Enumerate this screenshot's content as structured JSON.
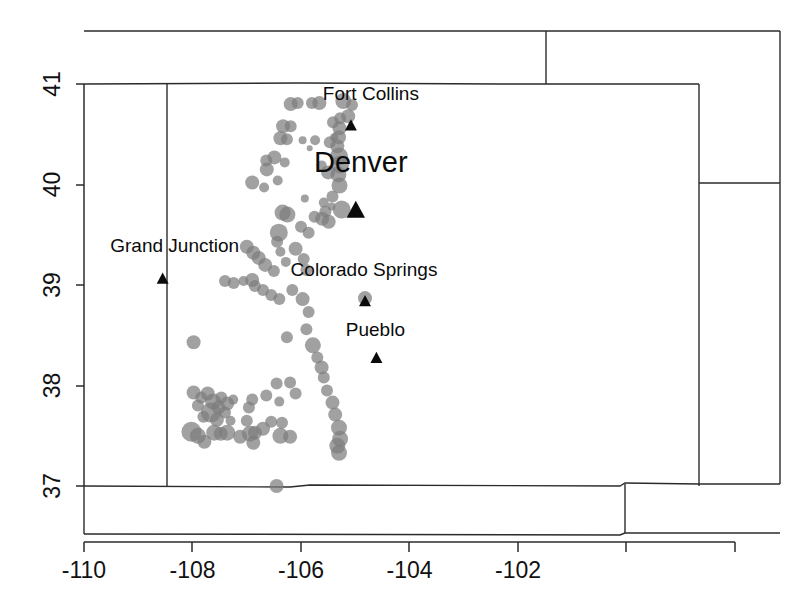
{
  "figure": {
    "title": "",
    "background": "#ffffff",
    "point_color": "#7d7d7d",
    "line_color": "#2b2b2b",
    "marker_color": "#0b0b0b"
  },
  "axes": {
    "x_ticks": [
      "-110",
      "-108",
      "-106",
      "-104",
      "-102"
    ],
    "x_tick_values": [
      -110,
      -108,
      -106,
      -104,
      -102
    ],
    "y_ticks": [
      "37",
      "38",
      "39",
      "40",
      "41"
    ],
    "y_tick_values": [
      37,
      38,
      39,
      40,
      41
    ],
    "xlabel": "",
    "ylabel": "",
    "xlim": [
      -110.5,
      -101.2
    ],
    "ylim": [
      36.5,
      41.5
    ],
    "grid": false
  },
  "cities": [
    {
      "name": "Fort Collins",
      "lon": -105.08,
      "lat": 40.585,
      "label_size": "normal",
      "label_dx": 20,
      "label_dy": -19
    },
    {
      "name": "Denver",
      "lon": -104.99,
      "lat": 39.74,
      "label_size": "major",
      "label_dx": 5,
      "label_dy": -29
    },
    {
      "name": "Colorado Springs",
      "lon": -104.82,
      "lat": 38.835,
      "label_size": "normal",
      "label_dx": -1,
      "label_dy": -19
    },
    {
      "name": "Pueblo",
      "lon": -104.61,
      "lat": 38.27,
      "label_size": "normal",
      "label_dx": -1,
      "label_dy": -16
    },
    {
      "name": "Grand Junction",
      "lon": -108.55,
      "lat": 39.06,
      "label_size": "normal",
      "label_dx": 12,
      "label_dy": -21
    }
  ],
  "chart_data": {
    "type": "scatter",
    "title": "",
    "xlabel": "",
    "ylabel": "",
    "xlim": [
      -110.5,
      -101.2
    ],
    "ylim": [
      36.5,
      41.5
    ],
    "grid": false,
    "point_color": "#7d7d7d",
    "point_opacity": 0.72,
    "size_encodes": "magnitude",
    "size_range_px": [
      3,
      11
    ],
    "legend": null,
    "note": "Earthquake epicenters in Colorado; marker area scales with event magnitude. Triangles mark major cities.",
    "points": [
      {
        "lon": -106.19,
        "lat": 40.8,
        "r": 7
      },
      {
        "lon": -106.06,
        "lat": 40.81,
        "r": 6
      },
      {
        "lon": -105.8,
        "lat": 40.81,
        "r": 6
      },
      {
        "lon": -105.66,
        "lat": 40.81,
        "r": 7
      },
      {
        "lon": -105.22,
        "lat": 40.83,
        "r": 8
      },
      {
        "lon": -105.06,
        "lat": 40.79,
        "r": 6
      },
      {
        "lon": -105.13,
        "lat": 40.68,
        "r": 7
      },
      {
        "lon": -105.28,
        "lat": 40.66,
        "r": 6
      },
      {
        "lon": -106.33,
        "lat": 40.58,
        "r": 7
      },
      {
        "lon": -106.19,
        "lat": 40.58,
        "r": 6
      },
      {
        "lon": -105.41,
        "lat": 40.62,
        "r": 6
      },
      {
        "lon": -105.29,
        "lat": 40.56,
        "r": 7
      },
      {
        "lon": -106.38,
        "lat": 40.46,
        "r": 7
      },
      {
        "lon": -106.26,
        "lat": 40.45,
        "r": 6
      },
      {
        "lon": -105.97,
        "lat": 40.44,
        "r": 4
      },
      {
        "lon": -105.74,
        "lat": 40.44,
        "r": 5
      },
      {
        "lon": -105.39,
        "lat": 40.47,
        "r": 4
      },
      {
        "lon": -105.47,
        "lat": 40.42,
        "r": 6
      },
      {
        "lon": -105.3,
        "lat": 40.47,
        "r": 7
      },
      {
        "lon": -105.33,
        "lat": 40.38,
        "r": 7
      },
      {
        "lon": -105.3,
        "lat": 40.28,
        "r": 9
      },
      {
        "lon": -105.28,
        "lat": 40.2,
        "r": 9
      },
      {
        "lon": -105.31,
        "lat": 40.1,
        "r": 8
      },
      {
        "lon": -105.29,
        "lat": 39.99,
        "r": 8
      },
      {
        "lon": -105.84,
        "lat": 40.36,
        "r": 3
      },
      {
        "lon": -106.49,
        "lat": 40.27,
        "r": 7
      },
      {
        "lon": -106.64,
        "lat": 40.24,
        "r": 6
      },
      {
        "lon": -106.63,
        "lat": 40.15,
        "r": 7
      },
      {
        "lon": -106.3,
        "lat": 40.22,
        "r": 5
      },
      {
        "lon": -105.62,
        "lat": 40.19,
        "r": 5
      },
      {
        "lon": -105.5,
        "lat": 40.12,
        "r": 7
      },
      {
        "lon": -106.9,
        "lat": 40.02,
        "r": 7
      },
      {
        "lon": -106.68,
        "lat": 39.97,
        "r": 5
      },
      {
        "lon": -106.43,
        "lat": 40.04,
        "r": 5
      },
      {
        "lon": -105.42,
        "lat": 39.88,
        "r": 6
      },
      {
        "lon": -105.93,
        "lat": 39.86,
        "r": 4
      },
      {
        "lon": -105.58,
        "lat": 39.82,
        "r": 5
      },
      {
        "lon": -105.44,
        "lat": 39.78,
        "r": 4
      },
      {
        "lon": -105.55,
        "lat": 39.73,
        "r": 6
      },
      {
        "lon": -105.25,
        "lat": 39.75,
        "r": 9
      },
      {
        "lon": -106.34,
        "lat": 39.72,
        "r": 8
      },
      {
        "lon": -106.25,
        "lat": 39.7,
        "r": 8
      },
      {
        "lon": -105.75,
        "lat": 39.68,
        "r": 6
      },
      {
        "lon": -105.61,
        "lat": 39.66,
        "r": 7
      },
      {
        "lon": -105.49,
        "lat": 39.63,
        "r": 7
      },
      {
        "lon": -106.41,
        "lat": 39.52,
        "r": 9
      },
      {
        "lon": -106.0,
        "lat": 39.58,
        "r": 6
      },
      {
        "lon": -105.86,
        "lat": 39.52,
        "r": 6
      },
      {
        "lon": -107.0,
        "lat": 39.38,
        "r": 7
      },
      {
        "lon": -106.88,
        "lat": 39.32,
        "r": 7
      },
      {
        "lon": -106.78,
        "lat": 39.27,
        "r": 7
      },
      {
        "lon": -106.66,
        "lat": 39.2,
        "r": 7
      },
      {
        "lon": -106.5,
        "lat": 39.14,
        "r": 6
      },
      {
        "lon": -106.44,
        "lat": 39.43,
        "r": 6
      },
      {
        "lon": -106.38,
        "lat": 39.33,
        "r": 5
      },
      {
        "lon": -106.28,
        "lat": 39.23,
        "r": 5
      },
      {
        "lon": -106.1,
        "lat": 39.36,
        "r": 7
      },
      {
        "lon": -105.95,
        "lat": 39.26,
        "r": 6
      },
      {
        "lon": -105.9,
        "lat": 39.15,
        "r": 6
      },
      {
        "lon": -107.4,
        "lat": 39.04,
        "r": 6
      },
      {
        "lon": -107.24,
        "lat": 39.02,
        "r": 6
      },
      {
        "lon": -107.06,
        "lat": 39.04,
        "r": 5
      },
      {
        "lon": -106.9,
        "lat": 39.05,
        "r": 7
      },
      {
        "lon": -106.85,
        "lat": 38.99,
        "r": 6
      },
      {
        "lon": -106.7,
        "lat": 38.95,
        "r": 6
      },
      {
        "lon": -106.55,
        "lat": 38.9,
        "r": 6
      },
      {
        "lon": -106.4,
        "lat": 38.86,
        "r": 6
      },
      {
        "lon": -106.16,
        "lat": 38.95,
        "r": 6
      },
      {
        "lon": -105.97,
        "lat": 38.86,
        "r": 7
      },
      {
        "lon": -104.82,
        "lat": 38.87,
        "r": 7
      },
      {
        "lon": -105.86,
        "lat": 38.73,
        "r": 6
      },
      {
        "lon": -105.9,
        "lat": 38.56,
        "r": 6
      },
      {
        "lon": -106.26,
        "lat": 38.48,
        "r": 6
      },
      {
        "lon": -107.98,
        "lat": 38.43,
        "r": 7
      },
      {
        "lon": -105.78,
        "lat": 38.4,
        "r": 8
      },
      {
        "lon": -105.7,
        "lat": 38.28,
        "r": 6
      },
      {
        "lon": -105.62,
        "lat": 38.18,
        "r": 7
      },
      {
        "lon": -105.58,
        "lat": 38.08,
        "r": 6
      },
      {
        "lon": -105.52,
        "lat": 37.95,
        "r": 6
      },
      {
        "lon": -105.42,
        "lat": 37.83,
        "r": 7
      },
      {
        "lon": -105.37,
        "lat": 37.71,
        "r": 7
      },
      {
        "lon": -105.3,
        "lat": 37.58,
        "r": 8
      },
      {
        "lon": -105.28,
        "lat": 37.47,
        "r": 8
      },
      {
        "lon": -105.33,
        "lat": 37.4,
        "r": 8
      },
      {
        "lon": -105.3,
        "lat": 37.33,
        "r": 8
      },
      {
        "lon": -106.2,
        "lat": 38.03,
        "r": 6
      },
      {
        "lon": -106.45,
        "lat": 38.02,
        "r": 6
      },
      {
        "lon": -106.1,
        "lat": 37.92,
        "r": 6
      },
      {
        "lon": -106.4,
        "lat": 37.84,
        "r": 5
      },
      {
        "lon": -106.64,
        "lat": 37.9,
        "r": 6
      },
      {
        "lon": -106.9,
        "lat": 37.86,
        "r": 6
      },
      {
        "lon": -106.96,
        "lat": 37.78,
        "r": 6
      },
      {
        "lon": -107.0,
        "lat": 37.65,
        "r": 6
      },
      {
        "lon": -106.55,
        "lat": 37.64,
        "r": 6
      },
      {
        "lon": -106.35,
        "lat": 37.63,
        "r": 6
      },
      {
        "lon": -106.7,
        "lat": 37.57,
        "r": 7
      },
      {
        "lon": -106.85,
        "lat": 37.53,
        "r": 7
      },
      {
        "lon": -106.38,
        "lat": 37.5,
        "r": 8
      },
      {
        "lon": -106.2,
        "lat": 37.49,
        "r": 7
      },
      {
        "lon": -107.98,
        "lat": 37.93,
        "r": 7
      },
      {
        "lon": -107.84,
        "lat": 37.88,
        "r": 6
      },
      {
        "lon": -107.9,
        "lat": 37.8,
        "r": 6
      },
      {
        "lon": -107.72,
        "lat": 37.92,
        "r": 7
      },
      {
        "lon": -107.62,
        "lat": 37.84,
        "r": 8
      },
      {
        "lon": -107.52,
        "lat": 37.78,
        "r": 7
      },
      {
        "lon": -107.47,
        "lat": 37.88,
        "r": 6
      },
      {
        "lon": -107.36,
        "lat": 37.82,
        "r": 7
      },
      {
        "lon": -107.25,
        "lat": 37.86,
        "r": 5
      },
      {
        "lon": -107.66,
        "lat": 37.73,
        "r": 10
      },
      {
        "lon": -107.8,
        "lat": 37.69,
        "r": 6
      },
      {
        "lon": -107.55,
        "lat": 37.66,
        "r": 7
      },
      {
        "lon": -107.4,
        "lat": 37.73,
        "r": 6
      },
      {
        "lon": -107.3,
        "lat": 37.65,
        "r": 5
      },
      {
        "lon": -108.02,
        "lat": 37.54,
        "r": 10
      },
      {
        "lon": -107.9,
        "lat": 37.5,
        "r": 8
      },
      {
        "lon": -107.6,
        "lat": 37.53,
        "r": 8
      },
      {
        "lon": -107.48,
        "lat": 37.52,
        "r": 7
      },
      {
        "lon": -107.36,
        "lat": 37.53,
        "r": 8
      },
      {
        "lon": -107.12,
        "lat": 37.49,
        "r": 7
      },
      {
        "lon": -106.94,
        "lat": 37.52,
        "r": 8
      },
      {
        "lon": -107.78,
        "lat": 37.44,
        "r": 7
      },
      {
        "lon": -106.88,
        "lat": 37.43,
        "r": 7
      },
      {
        "lon": -106.45,
        "lat": 37.0,
        "r": 7
      }
    ]
  },
  "boundaries": {
    "description": "State outlines: Colorado with neighbouring Wyoming, Nebraska, Kansas, Oklahoma panhandle, New Mexico, Utah."
  }
}
